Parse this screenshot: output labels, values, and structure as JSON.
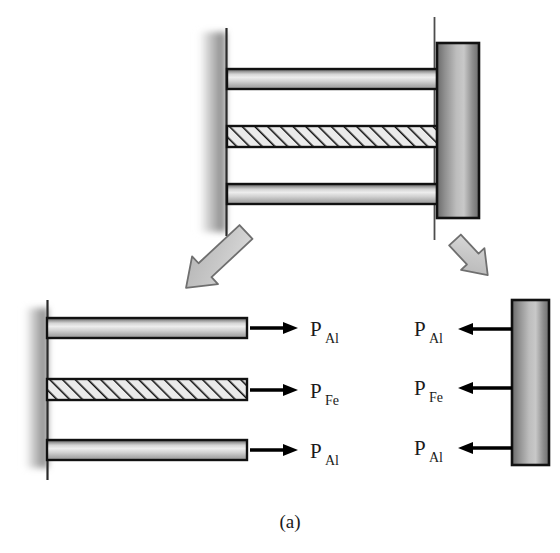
{
  "figure": {
    "caption": "(a)"
  },
  "colors": {
    "bar_outline": "#111111",
    "bar_light": "#e8e8e8",
    "bar_mid": "#a8a8a8",
    "bar_dark": "#4a4a4a",
    "plate_dark": "#5e5e5e",
    "plate_light": "#cfcfcf",
    "hatch_fill": "#e6e6e6",
    "hatch_line": "#111111",
    "arrow_block_fill": "#c9c9c9",
    "arrow_block_outline": "#6e6e6e",
    "force_arrow": "#000000",
    "wall_line": "#222222",
    "wall_shadow": "#9a9a9a",
    "background": "#ffffff"
  },
  "assembly_view": {
    "name": "top-assembly",
    "wall_label": "fixed-support",
    "bars": [
      {
        "id": "bar-top",
        "material": "Al",
        "style": "gradient"
      },
      {
        "id": "bar-middle",
        "material": "Fe",
        "style": "hatched"
      },
      {
        "id": "bar-bottom",
        "material": "Al",
        "style": "gradient"
      }
    ],
    "end_plate": {
      "id": "end-plate",
      "style": "gradient"
    },
    "reference_lines": 2
  },
  "callout_arrows": [
    {
      "id": "callout-arrow-left",
      "direction": "down-left",
      "target": "bars-free-body"
    },
    {
      "id": "callout-arrow-right",
      "direction": "down-right",
      "target": "plate-free-body"
    }
  ],
  "bars_free_body": {
    "name": "bars-free-body",
    "wall_label": "fixed-support",
    "members": [
      {
        "id": "fb-bar-top",
        "material": "Al",
        "style": "gradient",
        "force_label": "P",
        "force_subscript": "Al",
        "arrow_direction": "right"
      },
      {
        "id": "fb-bar-middle",
        "material": "Fe",
        "style": "hatched",
        "force_label": "P",
        "force_subscript": "Fe",
        "arrow_direction": "right"
      },
      {
        "id": "fb-bar-bottom",
        "material": "Al",
        "style": "gradient",
        "force_label": "P",
        "force_subscript": "Al",
        "arrow_direction": "right"
      }
    ]
  },
  "plate_free_body": {
    "name": "plate-free-body",
    "plate": {
      "id": "fb-end-plate",
      "style": "gradient"
    },
    "forces": [
      {
        "id": "fb-force-top",
        "force_label": "P",
        "force_subscript": "Al",
        "arrow_direction": "left"
      },
      {
        "id": "fb-force-middle",
        "force_label": "P",
        "force_subscript": "Fe",
        "arrow_direction": "left"
      },
      {
        "id": "fb-force-bottom",
        "force_label": "P",
        "force_subscript": "Al",
        "arrow_direction": "left"
      }
    ]
  }
}
